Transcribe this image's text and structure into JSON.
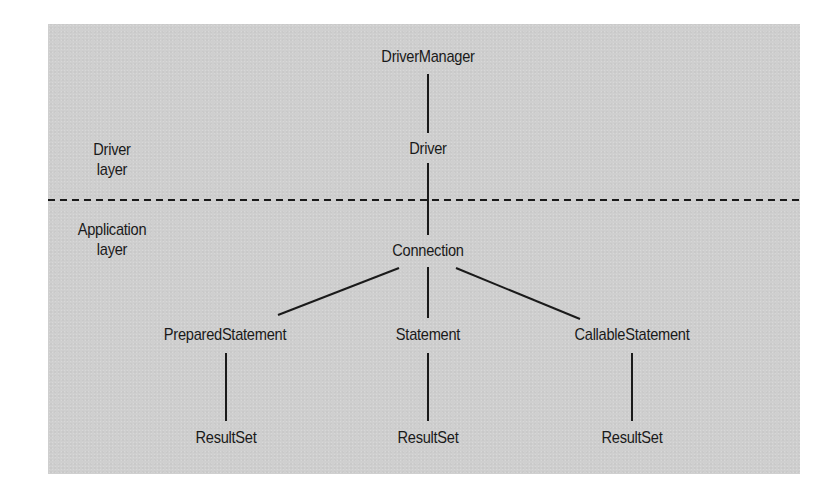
{
  "diagram": {
    "background_color": "#cfcfcf",
    "line_color": "#1a1a1a",
    "layers": {
      "driver": {
        "line1": "Driver",
        "line2": "layer"
      },
      "application": {
        "line1": "Application",
        "line2": "layer"
      }
    },
    "nodes": {
      "driver_manager": "DriverManager",
      "driver": "Driver",
      "connection": "Connection",
      "prepared_statement": "PreparedStatement",
      "statement": "Statement",
      "callable_statement": "CallableStatement",
      "result_set_prepared": "ResultSet",
      "result_set_statement": "ResultSet",
      "result_set_callable": "ResultSet"
    },
    "edges": [
      [
        "DriverManager",
        "Driver"
      ],
      [
        "Driver",
        "Connection"
      ],
      [
        "Connection",
        "PreparedStatement"
      ],
      [
        "Connection",
        "Statement"
      ],
      [
        "Connection",
        "CallableStatement"
      ],
      [
        "PreparedStatement",
        "ResultSet"
      ],
      [
        "Statement",
        "ResultSet"
      ],
      [
        "CallableStatement",
        "ResultSet"
      ]
    ],
    "separator": "dashed line between Driver layer and Application layer"
  }
}
